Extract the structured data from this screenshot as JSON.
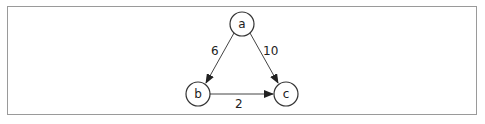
{
  "graph": {
    "nodes": [
      {
        "id": "a",
        "label": "a",
        "x": 242,
        "y": 24
      },
      {
        "id": "b",
        "label": "b",
        "x": 198,
        "y": 94
      },
      {
        "id": "c",
        "label": "c",
        "x": 286,
        "y": 94
      }
    ],
    "edges": [
      {
        "from": "a",
        "to": "b",
        "weight": "6"
      },
      {
        "from": "a",
        "to": "c",
        "weight": "10"
      },
      {
        "from": "b",
        "to": "c",
        "weight": "2"
      }
    ],
    "colors": {
      "stroke": "#333333",
      "frame": "#9a9a9a"
    }
  }
}
